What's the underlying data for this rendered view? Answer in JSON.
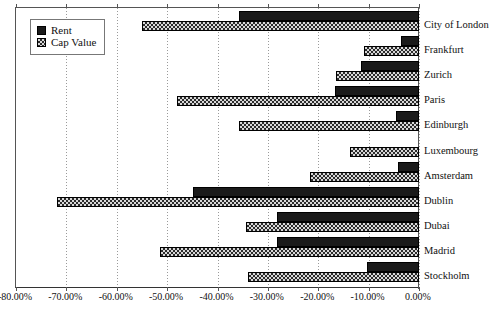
{
  "legend": {
    "position": "top-left",
    "entries": [
      {
        "key": "rent",
        "label": "Rent",
        "swatch": "solid-black-square-icon"
      },
      {
        "key": "cap",
        "label": "Cap Value",
        "swatch": "checkered-square-icon"
      }
    ]
  },
  "axis": {
    "tick_labels": [
      "-80.00%",
      "-70.00%",
      "-60.00%",
      "-50.00%",
      "-40.00%",
      "-30.00%",
      "-20.00%",
      "-10.00%",
      "0.00%"
    ],
    "tick_values": [
      -80,
      -70,
      -60,
      -50,
      -40,
      -30,
      -20,
      -10,
      0
    ]
  },
  "chart_data": {
    "type": "bar",
    "orientation": "horizontal",
    "title": "",
    "subtitle": "",
    "xlabel": "",
    "ylabel": "",
    "xlim": [
      -80,
      0
    ],
    "grid": true,
    "legend_position": "top-left",
    "categories": [
      "City of London",
      "Frankfurt",
      "Zurich",
      "Paris",
      "Edinburgh",
      "Luxembourg",
      "Amsterdam",
      "Dublin",
      "Dubai",
      "Madrid",
      "Stockholm"
    ],
    "series": [
      {
        "name": "Rent",
        "values": [
          -35.7,
          -3.6,
          -11.5,
          -16.7,
          -4.6,
          0.0,
          -4.2,
          -44.8,
          -28.2,
          -28.2,
          -10.3
        ]
      },
      {
        "name": "Cap Value",
        "values": [
          -55.0,
          -11.0,
          -16.5,
          -48.0,
          -35.7,
          -13.7,
          -21.6,
          -71.8,
          -34.3,
          -51.4,
          -34.0
        ]
      }
    ]
  }
}
